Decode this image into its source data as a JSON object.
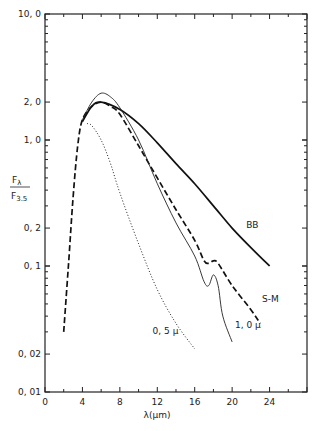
{
  "chart_data": {
    "type": "line",
    "title": "",
    "xlabel": "λ(μm)",
    "ylabel_num": "F",
    "ylabel_num_sub": "λ",
    "ylabel_den": "F",
    "ylabel_den_sub": "3.5",
    "xlim": [
      0,
      28
    ],
    "ylim": [
      0.01,
      10.0
    ],
    "yscale": "log",
    "grid": false,
    "legend": "none (curves labeled inline)",
    "x_ticks": [
      "0",
      "4",
      "8",
      "12",
      "16",
      "20",
      "24"
    ],
    "y_ticks": [
      "10, 0",
      "2, 0",
      "1, 0",
      "0, 2",
      "0, 1",
      "0, 02",
      "0, 01"
    ],
    "series": [
      {
        "name": "BB",
        "style": "solid-thick",
        "x": [
          4,
          5,
          6,
          8,
          10,
          12,
          14,
          16,
          18,
          20,
          22,
          24
        ],
        "values": [
          1.4,
          1.85,
          2.0,
          1.75,
          1.35,
          0.95,
          0.65,
          0.45,
          0.3,
          0.2,
          0.14,
          0.1
        ]
      },
      {
        "name": "S-M",
        "style": "dashed",
        "x": [
          2,
          2.5,
          3,
          3.5,
          4,
          5,
          6,
          7,
          8,
          10,
          12,
          14,
          16,
          17,
          17.5,
          18,
          18.5,
          20,
          22,
          23
        ],
        "values": [
          0.03,
          0.1,
          0.35,
          0.9,
          1.45,
          1.85,
          2.0,
          1.85,
          1.6,
          0.9,
          0.5,
          0.28,
          0.16,
          0.11,
          0.105,
          0.11,
          0.105,
          0.07,
          0.045,
          0.035
        ]
      },
      {
        "name": "1.0 μ",
        "style": "solid-thin",
        "x": [
          4,
          5,
          6,
          7,
          8,
          10,
          12,
          14,
          16,
          17,
          17.5,
          18,
          18.5,
          19,
          20
        ],
        "values": [
          1.45,
          2.0,
          2.35,
          2.2,
          1.8,
          1.0,
          0.45,
          0.22,
          0.12,
          0.075,
          0.07,
          0.085,
          0.07,
          0.04,
          0.025
        ]
      },
      {
        "name": "0.5 μ",
        "style": "dotted",
        "x": [
          4.5,
          5,
          6,
          7,
          8,
          10,
          12,
          14,
          16
        ],
        "values": [
          1.35,
          1.3,
          1.0,
          0.65,
          0.38,
          0.15,
          0.065,
          0.035,
          0.022
        ]
      }
    ],
    "annotations": [
      {
        "text": "BB",
        "x": 21.5,
        "y": 0.2
      },
      {
        "text": "S-M",
        "x": 23.2,
        "y": 0.052
      },
      {
        "text": "1, 0 μ",
        "x": 20.3,
        "y": 0.032
      },
      {
        "text": "0, 5 μ",
        "x": 11.5,
        "y": 0.029
      }
    ]
  }
}
